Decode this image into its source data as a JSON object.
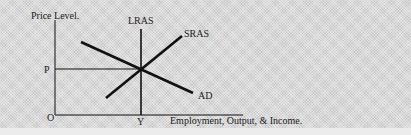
{
  "diagram": {
    "axes": {
      "y_label": "Price Level.",
      "x_label": "Employment, Output, & Income.",
      "origin_label": "O",
      "price_label": "P",
      "output_label": "Y"
    },
    "curves": [
      {
        "name": "LRAS",
        "type": "vertical",
        "x": 141,
        "y1": 29,
        "y2": 115
      },
      {
        "name": "SRAS",
        "type": "upward",
        "x1": 106,
        "y1": 98,
        "x2": 182,
        "y2": 36
      },
      {
        "name": "AD",
        "type": "downward",
        "x1": 81,
        "y1": 42,
        "x2": 193,
        "y2": 93
      }
    ],
    "equilibrium": {
      "x": 141,
      "y": 69
    },
    "colors": {
      "line": "#111111",
      "background": "#d9d9d9",
      "text": "#222222"
    }
  }
}
